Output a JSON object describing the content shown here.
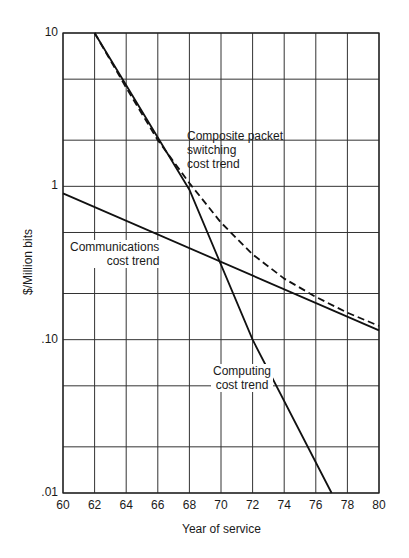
{
  "chart_data": {
    "type": "line",
    "title": "",
    "xlabel": "Year of service",
    "ylabel": "$/Million bits",
    "xlim": [
      60,
      80
    ],
    "ylim": [
      0.01,
      10
    ],
    "yscale": "log",
    "grid": true,
    "x_ticks": [
      "60",
      "62",
      "64",
      "66",
      "68",
      "70",
      "72",
      "74",
      "76",
      "78",
      "80"
    ],
    "y_ticks": [
      {
        "value": 10,
        "label": "10"
      },
      {
        "value": 1,
        "label": "1"
      },
      {
        "value": 0.1,
        "label": ".10"
      },
      {
        "value": 0.01,
        "label": ".01"
      }
    ],
    "y_gridlines": [
      10,
      5,
      2,
      1,
      0.5,
      0.2,
      0.1,
      0.05,
      0.02,
      0.01
    ],
    "series": [
      {
        "name": "Communications cost trend",
        "style": "solid",
        "x": [
          60,
          80
        ],
        "y": [
          0.9,
          0.115
        ]
      },
      {
        "name": "Computing cost trend",
        "style": "solid",
        "x": [
          62,
          68,
          72,
          77
        ],
        "y": [
          10,
          0.95,
          0.1,
          0.01
        ]
      },
      {
        "name": "Composite packet switching cost trend",
        "style": "dashed",
        "x": [
          62,
          64,
          66,
          68,
          70,
          72,
          74,
          76,
          78,
          80
        ],
        "y": [
          10,
          4.4,
          2.0,
          1.05,
          0.58,
          0.36,
          0.25,
          0.19,
          0.15,
          0.123
        ]
      }
    ],
    "annotations": [
      {
        "text_lines": [
          "Composite packet",
          "switching",
          "cost trend"
        ],
        "series": "Composite packet switching cost trend"
      },
      {
        "text_lines": [
          "Communications",
          "cost trend"
        ],
        "series": "Communications cost trend"
      },
      {
        "text_lines": [
          "Computing",
          "cost trend"
        ],
        "series": "Computing cost trend"
      }
    ]
  },
  "labels": {
    "composite": [
      "Composite packet",
      "switching",
      "cost trend"
    ],
    "communications": [
      "Communications",
      "cost trend"
    ],
    "computing": [
      "Computing",
      "cost trend"
    ]
  }
}
